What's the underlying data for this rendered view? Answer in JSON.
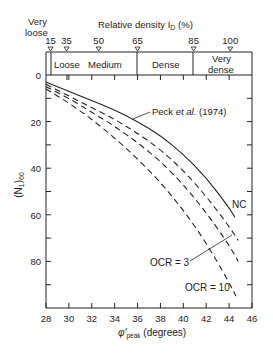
{
  "chart_data": {
    "type": "line",
    "title": "",
    "xlabel": "φ'peak (degrees)",
    "ylabel": "(N1)60",
    "xlim": [
      28,
      46
    ],
    "ylim": [
      100,
      0
    ],
    "y_inverted": true,
    "x_ticks": [
      28,
      30,
      32,
      34,
      36,
      38,
      40,
      42,
      44,
      46
    ],
    "y_ticks": [
      0,
      20,
      40,
      60,
      80
    ],
    "grid": false,
    "top_axis": {
      "label": "Relative density I_D (%)",
      "ticks": [
        {
          "label": "15",
          "phi": 28.4
        },
        {
          "label": "35",
          "phi": 29.8
        },
        {
          "label": "50",
          "phi": 32.6
        },
        {
          "label": "65",
          "phi": 36.0
        },
        {
          "label": "85",
          "phi": 40.9
        },
        {
          "label": "100",
          "phi": 44.1
        }
      ],
      "zones": [
        {
          "label": "Very loose",
          "from": 28,
          "to": 28.4
        },
        {
          "label": "Loose",
          "from": 28.4,
          "to": 30.0
        },
        {
          "label": "Medium",
          "from": 30.0,
          "to": 36.0
        },
        {
          "label": "Dense",
          "from": 36.0,
          "to": 40.9
        },
        {
          "label": "Very dense",
          "from": 40.9,
          "to": 46
        }
      ]
    },
    "series": [
      {
        "name": "Peck et al. (1974)",
        "style": "solid",
        "x": [
          28,
          30,
          32,
          34,
          36,
          38,
          40,
          42,
          44,
          44.5
        ],
        "y": [
          3,
          7,
          11,
          15,
          20,
          26,
          34,
          44,
          57,
          61
        ]
      },
      {
        "name": "NC",
        "style": "dashed",
        "x": [
          28,
          30,
          32,
          34,
          36,
          38,
          40,
          42,
          44,
          44.8
        ],
        "y": [
          4,
          9,
          14,
          19,
          25,
          32,
          41,
          52,
          65,
          71
        ]
      },
      {
        "name": "OCR = 3",
        "style": "dashed",
        "x": [
          28,
          30,
          32,
          34,
          36,
          38,
          40,
          42,
          44,
          44.8
        ],
        "y": [
          5,
          10,
          16,
          22,
          29,
          37,
          47,
          59,
          73,
          80
        ]
      },
      {
        "name": "OCR = 10",
        "style": "dashed",
        "x": [
          28,
          30,
          32,
          34,
          36,
          38,
          40,
          42,
          44,
          44.6
        ],
        "y": [
          6,
          12,
          19,
          27,
          36,
          46,
          58,
          72,
          89,
          95
        ]
      }
    ],
    "annotations": [
      {
        "text": "Peck et al. (1974)",
        "x": 38.5,
        "y": 16
      },
      {
        "text": "NC",
        "x": 44.0,
        "y": 58
      },
      {
        "text": "OCR = 3",
        "x": 35.0,
        "y": 80
      },
      {
        "text": "OCR = 10",
        "x": 40.8,
        "y": 89
      }
    ]
  },
  "labels": {
    "very_loose_1": "Very",
    "very_loose_2": "loose",
    "top_axis_title": "Relative density I",
    "top_axis_sub": "D",
    "top_axis_unit": " (%)",
    "loose": "Loose",
    "medium": "Medium",
    "dense": "Dense",
    "very_dense_1": "Very",
    "very_dense_2": "dense",
    "peck": "Peck ",
    "peck_etal": "et al.",
    "peck_year": " (1974)",
    "nc": "NC",
    "ocr3": "OCR = 3",
    "ocr10": "OCR = 10",
    "ylabel_main": "(N",
    "ylabel_sub1": "1",
    "ylabel_close": ")",
    "ylabel_sub2": "60",
    "xlabel_main": "φ'",
    "xlabel_sub": "peak",
    "xlabel_unit": " (degrees)"
  }
}
